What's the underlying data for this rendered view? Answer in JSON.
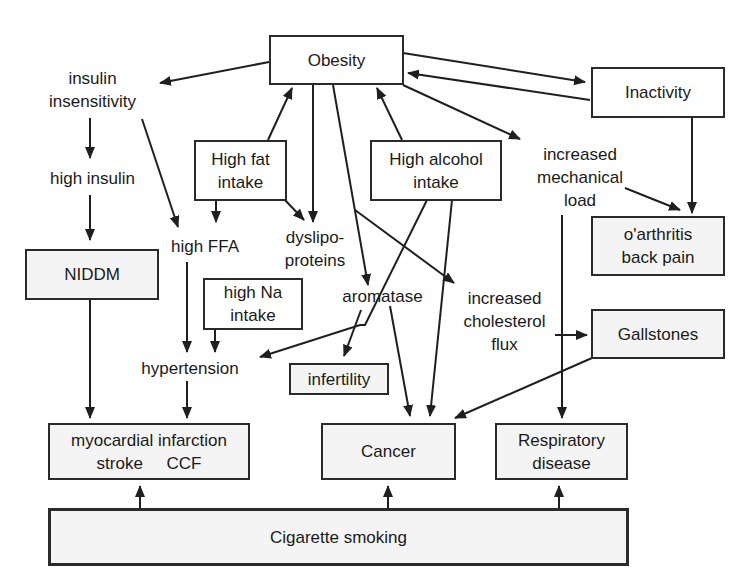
{
  "diagram": {
    "colors": {
      "line": "#1f1f1f",
      "box_border": "#2a2a2a",
      "box_fill": "#ffffff",
      "shaded_fill": "#f4f4f4",
      "text": "#1a1a1a"
    },
    "nodes": {
      "obesity": {
        "lines": [
          "Obesity"
        ]
      },
      "inactivity": {
        "lines": [
          "Inactivity"
        ]
      },
      "insulin_insensitivity": {
        "lines": [
          "insulin",
          "insensitivity"
        ]
      },
      "high_insulin": {
        "lines": [
          "high insulin"
        ]
      },
      "niddm": {
        "lines": [
          "NIDDM"
        ]
      },
      "high_fat_intake": {
        "lines": [
          "High fat",
          "intake"
        ]
      },
      "high_alcohol_intake": {
        "lines": [
          "High alcohol",
          "intake"
        ]
      },
      "increased_mechanical_load": {
        "lines": [
          "increased",
          "mechanical",
          "load"
        ]
      },
      "osteoarthritis": {
        "lines": [
          "o'arthritis",
          "back pain"
        ]
      },
      "high_ffa": {
        "lines": [
          "high FFA"
        ]
      },
      "dyslipoproteins": {
        "lines": [
          "dyslipo-",
          "proteins"
        ]
      },
      "high_na_intake": {
        "lines": [
          "high Na",
          "intake"
        ]
      },
      "aromatase": {
        "lines": [
          "aromatase"
        ]
      },
      "increased_cholesterol_flux": {
        "lines": [
          "increased",
          "cholesterol",
          "flux"
        ]
      },
      "gallstones": {
        "lines": [
          "Gallstones"
        ]
      },
      "hypertension": {
        "lines": [
          "hypertension"
        ]
      },
      "infertility": {
        "lines": [
          "infertility"
        ]
      },
      "cardiovascular": {
        "lines": [
          "myocardial infarction",
          "stroke     CCF"
        ]
      },
      "cancer": {
        "lines": [
          "Cancer"
        ]
      },
      "respiratory_disease": {
        "lines": [
          "Respiratory",
          "disease"
        ]
      },
      "cigarette_smoking": {
        "lines": [
          "Cigarette smoking"
        ]
      }
    },
    "edges": [
      {
        "from": "obesity",
        "to": "insulin_insensitivity"
      },
      {
        "from": "obesity",
        "to": "inactivity"
      },
      {
        "from": "inactivity",
        "to": "obesity"
      },
      {
        "from": "obesity",
        "to": "increased_mechanical_load"
      },
      {
        "from": "obesity",
        "to": "dyslipoproteins"
      },
      {
        "from": "obesity",
        "to": "aromatase"
      },
      {
        "from": "obesity",
        "to": "increased_cholesterol_flux"
      },
      {
        "from": "high_fat_intake",
        "to": "obesity"
      },
      {
        "from": "high_alcohol_intake",
        "to": "obesity"
      },
      {
        "from": "high_fat_intake",
        "to": "high_ffa"
      },
      {
        "from": "high_fat_intake",
        "to": "dyslipoproteins"
      },
      {
        "from": "insulin_insensitivity",
        "to": "high_insulin"
      },
      {
        "from": "insulin_insensitivity",
        "to": "high_ffa"
      },
      {
        "from": "high_insulin",
        "to": "niddm"
      },
      {
        "from": "niddm",
        "to": "cardiovascular"
      },
      {
        "from": "high_ffa",
        "to": "hypertension"
      },
      {
        "from": "high_na_intake",
        "to": "hypertension"
      },
      {
        "from": "high_alcohol_intake",
        "to": "hypertension"
      },
      {
        "from": "high_alcohol_intake",
        "to": "cancer"
      },
      {
        "from": "aromatase",
        "to": "infertility"
      },
      {
        "from": "aromatase",
        "to": "cancer"
      },
      {
        "from": "hypertension",
        "to": "cardiovascular"
      },
      {
        "from": "increased_mechanical_load",
        "to": "osteoarthritis"
      },
      {
        "from": "inactivity",
        "to": "osteoarthritis"
      },
      {
        "from": "increased_mechanical_load",
        "to": "respiratory_disease"
      },
      {
        "from": "increased_cholesterol_flux",
        "to": "gallstones"
      },
      {
        "from": "gallstones",
        "to": "cancer"
      },
      {
        "from": "cigarette_smoking",
        "to": "cardiovascular"
      },
      {
        "from": "cigarette_smoking",
        "to": "cancer"
      },
      {
        "from": "cigarette_smoking",
        "to": "respiratory_disease"
      }
    ]
  }
}
